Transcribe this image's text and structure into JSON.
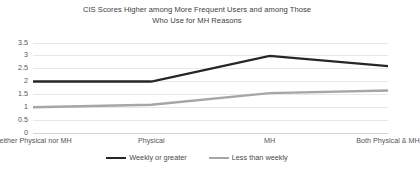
{
  "chart_data": {
    "type": "line",
    "title": "CIS Scores Higher among More Frequent Users and among Those Who Use for MH Reasons",
    "title_line1": "CIS Scores Higher among More Frequent Users and among Those",
    "title_line2": "Who Use for MH Reasons",
    "xlabel": "",
    "ylabel": "",
    "categories": [
      "Neither Physical nor MH",
      "Physical",
      "MH",
      "Both Physical & MH"
    ],
    "series": [
      {
        "name": "Weekly or greater",
        "color": "#262626",
        "values": [
          2.0,
          2.0,
          3.0,
          2.6
        ]
      },
      {
        "name": "Less than weekly",
        "color": "#a6a6a6",
        "values": [
          1.0,
          1.1,
          1.55,
          1.65
        ]
      }
    ],
    "ylim": [
      0,
      3.5
    ],
    "yticks": [
      0,
      0.5,
      1,
      1.5,
      2,
      2.5,
      3,
      3.5
    ],
    "ytick_labels": [
      "0",
      "0.5",
      "1",
      "1.5",
      "2",
      "2.5",
      "3",
      "3.5"
    ],
    "grid": true,
    "grid_color": "#e8e8e8",
    "legend_position": "bottom",
    "background": "#ffffff"
  }
}
